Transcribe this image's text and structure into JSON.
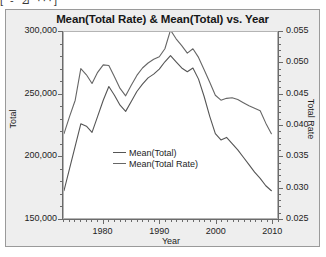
{
  "host_fragment": "[ - ⊿ ···]",
  "chart": {
    "title": "Mean(Total Rate) & Mean(Total) vs. Year",
    "frame_color": "#9a9a9a",
    "background": "#eeeeee",
    "plot_background": "#ffffff"
  },
  "legend": {
    "items": [
      {
        "label": "Mean(Total)",
        "color": "#555555"
      },
      {
        "label": "Mean(Total Rate)",
        "color": "#666666"
      }
    ]
  },
  "chart_data": {
    "type": "line",
    "title": "Mean(Total Rate) & Mean(Total) vs. Year",
    "xlabel": "Year",
    "ylabel": "Total",
    "y2label": "Total Rate",
    "xlim": [
      1973,
      2011
    ],
    "ylim": [
      150000,
      300000
    ],
    "y2lim": [
      0.025,
      0.055
    ],
    "xticks": [
      1980,
      1990,
      2000,
      2010
    ],
    "xticklabels": [
      "1980",
      "1990",
      "2000",
      "2010"
    ],
    "x_minor_step": 1,
    "yticks": [
      150000,
      200000,
      250000,
      300000
    ],
    "yticklabels": [
      "150,000",
      "200,000",
      "250,000",
      "300,000"
    ],
    "y_minor_step": 10000,
    "y2ticks": [
      0.025,
      0.03,
      0.035,
      0.04,
      0.045,
      0.05,
      0.055
    ],
    "y2ticklabels": [
      "0.025",
      "0.030",
      "0.035",
      "0.040",
      "0.045",
      "0.050",
      "0.055"
    ],
    "y2_minor_step": 0.001,
    "grid": false,
    "legend_position": "center-left-inside",
    "x": [
      1973,
      1974,
      1975,
      1976,
      1977,
      1978,
      1979,
      1980,
      1981,
      1982,
      1983,
      1984,
      1985,
      1986,
      1987,
      1988,
      1989,
      1990,
      1991,
      1992,
      1993,
      1994,
      1995,
      1996,
      1997,
      1998,
      1999,
      2000,
      2001,
      2002,
      2003,
      2004,
      2005,
      2006,
      2007,
      2008,
      2009,
      2010
    ],
    "series": [
      {
        "name": "Mean(Total)",
        "axis": "left",
        "color": "#555555",
        "values": [
          172000,
          190000,
          208000,
          226000,
          224000,
          219000,
          232000,
          245000,
          256000,
          249000,
          241000,
          236000,
          244000,
          252000,
          258000,
          263000,
          266000,
          270000,
          276000,
          281000,
          276000,
          271000,
          268000,
          271000,
          262000,
          248000,
          232000,
          218000,
          213000,
          215000,
          210000,
          205000,
          199000,
          193000,
          187000,
          182000,
          176000,
          172000
        ]
      },
      {
        "name": "Mean(Total Rate)",
        "axis": "right",
        "color": "#666666",
        "values": [
          0.0386,
          0.0414,
          0.044,
          0.0491,
          0.0481,
          0.0467,
          0.0485,
          0.0497,
          0.0496,
          0.0478,
          0.0459,
          0.0447,
          0.0464,
          0.048,
          0.0492,
          0.05,
          0.0506,
          0.051,
          0.0523,
          0.0553,
          0.0539,
          0.0528,
          0.0516,
          0.0523,
          0.0509,
          0.0489,
          0.0469,
          0.0448,
          0.044,
          0.0443,
          0.0444,
          0.0441,
          0.0436,
          0.0431,
          0.0427,
          0.0423,
          0.0403,
          0.0386
        ]
      }
    ]
  }
}
